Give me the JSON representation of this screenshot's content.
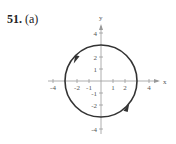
{
  "problem": {
    "number": "51.",
    "part": "(a)"
  },
  "chart_data": {
    "type": "parametric-curve",
    "title": "51. (a)",
    "curve": "circle",
    "center": [
      0,
      0
    ],
    "radius": 3,
    "orientation": "counterclockwise",
    "xlabel": "x",
    "ylabel": "y",
    "xlim": [
      -4.5,
      4.5
    ],
    "ylim": [
      -4.5,
      4.5
    ],
    "x_ticks": [
      -4,
      -2,
      -1,
      1,
      2,
      4
    ],
    "x_tick_labels": [
      "-4",
      "-2",
      "-1",
      "1",
      "2",
      "4"
    ],
    "y_ticks": [
      4,
      2,
      1,
      -1,
      -2,
      -4
    ],
    "y_tick_labels": [
      "4",
      "2",
      "1",
      "-1",
      "-2",
      "-4"
    ],
    "arrows": [
      {
        "position": "upper-left",
        "direction": "down-left"
      },
      {
        "position": "lower-right",
        "direction": "up-right"
      }
    ]
  },
  "colors": {
    "curve": "#333333",
    "axis": "#999999",
    "text": "#555555"
  }
}
